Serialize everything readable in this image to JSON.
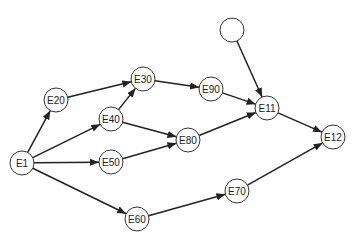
{
  "diagram": {
    "type": "directed-graph",
    "nodes": [
      {
        "id": "E1",
        "label": "E1",
        "x": 22,
        "y": 163
      },
      {
        "id": "E20",
        "label": "E20",
        "x": 56,
        "y": 100
      },
      {
        "id": "E30",
        "label": "E30",
        "x": 143,
        "y": 79
      },
      {
        "id": "E40",
        "label": "E40",
        "x": 111,
        "y": 119
      },
      {
        "id": "E50",
        "label": "E50",
        "x": 111,
        "y": 162
      },
      {
        "id": "E60",
        "label": "E60",
        "x": 137,
        "y": 219
      },
      {
        "id": "E70",
        "label": "E70",
        "x": 237,
        "y": 191
      },
      {
        "id": "E80",
        "label": "E80",
        "x": 188,
        "y": 140
      },
      {
        "id": "E90",
        "label": "E90",
        "x": 211,
        "y": 89
      },
      {
        "id": "E11",
        "label": "E11",
        "x": 267,
        "y": 108
      },
      {
        "id": "E12",
        "label": "E12",
        "x": 333,
        "y": 137
      },
      {
        "id": "blank",
        "label": "",
        "x": 232,
        "y": 30
      }
    ],
    "edges": [
      {
        "from": "E1",
        "to": "E20"
      },
      {
        "from": "E1",
        "to": "E40"
      },
      {
        "from": "E1",
        "to": "E50"
      },
      {
        "from": "E1",
        "to": "E60"
      },
      {
        "from": "E20",
        "to": "E30"
      },
      {
        "from": "E40",
        "to": "E30"
      },
      {
        "from": "E40",
        "to": "E80"
      },
      {
        "from": "E50",
        "to": "E80"
      },
      {
        "from": "E30",
        "to": "E90"
      },
      {
        "from": "E90",
        "to": "E11"
      },
      {
        "from": "E80",
        "to": "E11"
      },
      {
        "from": "blank",
        "to": "E11"
      },
      {
        "from": "E11",
        "to": "E12"
      },
      {
        "from": "E60",
        "to": "E70"
      },
      {
        "from": "E70",
        "to": "E12"
      }
    ],
    "node_radius": 12,
    "colors": {
      "stroke": "#333333",
      "edge": "#222222",
      "background": "#ffffff"
    }
  }
}
